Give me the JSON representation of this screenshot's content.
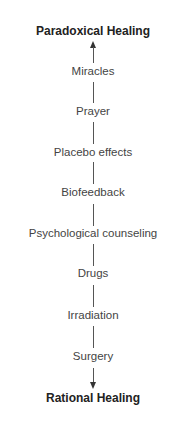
{
  "diagram": {
    "top_label": "Paradoxical Healing",
    "bottom_label": "Rational Healing",
    "items": [
      "Miracles",
      "Prayer",
      "Placebo effects",
      "Biofeedback",
      "Psychological counseling",
      "Drugs",
      "Irradiation",
      "Surgery"
    ]
  }
}
